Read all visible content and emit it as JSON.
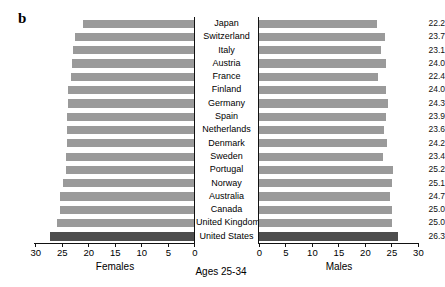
{
  "figure": {
    "panel_letter": "b",
    "center_title": "Ages 25-34",
    "left_axis_title": "Females",
    "right_axis_title": "Males"
  },
  "chart_data": {
    "type": "bar",
    "title": "Ages 25-34",
    "subtitle": "",
    "orientation": "horizontal",
    "layout": "back-to-back pyramid (left: Females, right: Males)",
    "xlabel_left": "Females",
    "xlabel_right": "Males",
    "ylabel": "",
    "grid": false,
    "legend": "none",
    "left_axis_ticks": [
      30,
      25,
      20,
      15,
      10,
      5,
      0
    ],
    "right_axis_ticks": [
      0,
      5,
      10,
      15,
      20,
      25,
      30
    ],
    "xlim_left": [
      30,
      0
    ],
    "xlim_right": [
      0,
      30
    ],
    "highlight_category": "United States",
    "highlight_color": "#4d4d4d",
    "bar_color": "#9a9a9a",
    "categories": [
      "Japan",
      "Switzerland",
      "Italy",
      "Austria",
      "France",
      "Finland",
      "Germany",
      "Spain",
      "Netherlands",
      "Denmark",
      "Sweden",
      "Portugal",
      "Norway",
      "Australia",
      "Canada",
      "United Kingdom",
      "United States"
    ],
    "series": [
      {
        "name": "Females",
        "side": "left",
        "values": [
          20.9,
          22.4,
          22.9,
          23.1,
          23.2,
          23.7,
          23.7,
          23.9,
          23.9,
          23.9,
          24.1,
          24.2,
          24.8,
          25.3,
          25.3,
          25.8,
          27.1
        ]
      },
      {
        "name": "Males",
        "side": "right",
        "values": [
          22.2,
          23.7,
          23.1,
          24.0,
          22.4,
          24.0,
          24.3,
          23.9,
          23.6,
          24.2,
          23.4,
          25.2,
          25.1,
          24.7,
          25.0,
          25.0,
          26.3
        ]
      }
    ],
    "value_labels_left": [
      "20.9",
      "22.4",
      "22.9",
      "23.1",
      "23.2",
      "23.7",
      "23.7",
      "23.9",
      "23.9",
      "23.9",
      "24.1",
      "24.2",
      "24.8",
      "25.3",
      "25.3",
      "25.8",
      "27.1"
    ],
    "value_labels_right": [
      "22.2",
      "23.7",
      "23.1",
      "24.0",
      "22.4",
      "24.0",
      "24.3",
      "23.9",
      "23.6",
      "24.2",
      "23.4",
      "25.2",
      "25.1",
      "24.7",
      "25.0",
      "25.0",
      "26.3"
    ]
  }
}
